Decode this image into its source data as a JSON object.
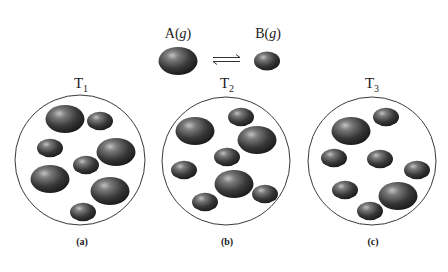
{
  "header": {
    "species_a": {
      "name": "A",
      "phase": "g",
      "molecule": "large"
    },
    "species_b": {
      "name": "B",
      "phase": "g",
      "molecule": "small"
    },
    "equilibrium_symbol": "⇌",
    "equilibrium_icon": "equilibrium-harpoons-icon"
  },
  "colors": {
    "molecule_dark": "#1e1e1e",
    "molecule_mid": "#555555",
    "molecule_highlight": "#b8b8b8",
    "container_stroke": "#3a3a3a",
    "background": "#ffffff"
  },
  "panels": [
    {
      "label": "(a)",
      "temperature": "T",
      "temperature_sub": "1",
      "count_A": 4,
      "count_B": 4,
      "container": {
        "cx": 80,
        "cy": 160,
        "r": 65
      },
      "molecules": [
        {
          "type": "A",
          "cx": 65,
          "cy": 119
        },
        {
          "type": "B",
          "cx": 100,
          "cy": 121
        },
        {
          "type": "B",
          "cx": 50,
          "cy": 148
        },
        {
          "type": "A",
          "cx": 116,
          "cy": 152
        },
        {
          "type": "B",
          "cx": 86,
          "cy": 165
        },
        {
          "type": "A",
          "cx": 50,
          "cy": 179
        },
        {
          "type": "A",
          "cx": 110,
          "cy": 191
        },
        {
          "type": "B",
          "cx": 83,
          "cy": 212
        }
      ]
    },
    {
      "label": "(b)",
      "temperature": "T",
      "temperature_sub": "2",
      "count_A": 3,
      "count_B": 5,
      "container": {
        "cx": 226,
        "cy": 161,
        "r": 64
      },
      "molecules": [
        {
          "type": "A",
          "cx": 195,
          "cy": 131
        },
        {
          "type": "B",
          "cx": 241,
          "cy": 117
        },
        {
          "type": "A",
          "cx": 257,
          "cy": 140
        },
        {
          "type": "B",
          "cx": 227,
          "cy": 157
        },
        {
          "type": "B",
          "cx": 184,
          "cy": 170
        },
        {
          "type": "A",
          "cx": 234,
          "cy": 184
        },
        {
          "type": "B",
          "cx": 265,
          "cy": 194
        },
        {
          "type": "B",
          "cx": 205,
          "cy": 202
        }
      ]
    },
    {
      "label": "(c)",
      "temperature": "T",
      "temperature_sub": "3",
      "count_A": 2,
      "count_B": 6,
      "container": {
        "cx": 372,
        "cy": 161,
        "r": 64
      },
      "molecules": [
        {
          "type": "A",
          "cx": 351,
          "cy": 131
        },
        {
          "type": "B",
          "cx": 386,
          "cy": 117
        },
        {
          "type": "B",
          "cx": 334,
          "cy": 158
        },
        {
          "type": "B",
          "cx": 380,
          "cy": 159
        },
        {
          "type": "B",
          "cx": 417,
          "cy": 170
        },
        {
          "type": "B",
          "cx": 345,
          "cy": 190
        },
        {
          "type": "A",
          "cx": 398,
          "cy": 196
        },
        {
          "type": "B",
          "cx": 370,
          "cy": 211
        }
      ]
    }
  ]
}
